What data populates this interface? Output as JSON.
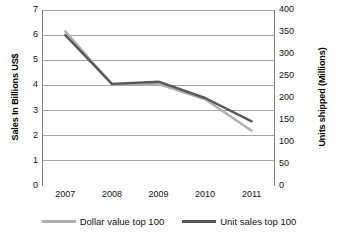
{
  "chart_data": {
    "type": "line",
    "title": "",
    "xlabel": "",
    "ylabel": "Sales In Billions US$",
    "y2label": "Units shipped (Millions)",
    "categories": [
      "2007",
      "2008",
      "2009",
      "2010",
      "2011"
    ],
    "grid": true,
    "legend_position": "bottom",
    "ylim": [
      0,
      7
    ],
    "y2lim": [
      0,
      400
    ],
    "yticks": [
      "7",
      "6",
      "5",
      "4",
      "3",
      "2",
      "1",
      "0"
    ],
    "ytick_values": [
      7,
      6,
      5,
      4,
      3,
      2,
      1,
      0
    ],
    "y2ticks": [
      "400",
      "350",
      "300",
      "250",
      "200",
      "150",
      "100",
      "50",
      "0"
    ],
    "y2tick_values": [
      400,
      350,
      300,
      250,
      200,
      150,
      100,
      50,
      0
    ],
    "series": [
      {
        "name": "Dollar value top 100",
        "axis": "left",
        "color": "#b0b0b0",
        "values": [
          6.15,
          4.05,
          4.05,
          3.45,
          2.2
        ]
      },
      {
        "name": "Unit sales top 100",
        "axis": "right",
        "color": "#585858",
        "values": [
          343,
          232,
          237,
          200,
          147
        ]
      }
    ]
  },
  "axes": {
    "left_title": "Sales In Billions US$",
    "right_title": "Units shipped (Millions)"
  },
  "legend": {
    "items": [
      {
        "label": "Dollar value top 100",
        "color": "#b0b0b0"
      },
      {
        "label": "Unit sales top 100",
        "color": "#585858"
      }
    ]
  },
  "colors": {
    "dollar_value": "#b0b0b0",
    "unit_sales": "#585858",
    "gridline": "#a6a6a6",
    "axis": "#808080",
    "background": "#ffffff"
  }
}
